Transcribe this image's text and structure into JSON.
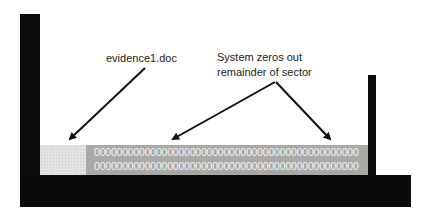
{
  "diagram": {
    "labels": {
      "file_label": "evidence1.doc",
      "system_label_line1": "System zeros out",
      "system_label_line2": "remainder of sector"
    },
    "sector": {
      "zero_rows": [
        "00000000000000000000000000000000000000000000000",
        "00000000000000000000000000000000000000000000000"
      ]
    },
    "colors": {
      "structure": "#0c0c0c",
      "file_block": "#e2e2e2",
      "zero_block": "#a9a9a9",
      "zero_text": "#f4f4f4",
      "arrow": "#111111"
    }
  }
}
